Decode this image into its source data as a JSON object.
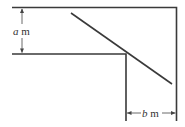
{
  "diagram": {
    "type": "corridor-corner-ladder",
    "labels": {
      "a_var": "a",
      "a_unit": " m",
      "b_var": "b",
      "b_unit": " m"
    },
    "colors": {
      "stroke": "#3a3a3a",
      "background": "#ffffff"
    }
  }
}
